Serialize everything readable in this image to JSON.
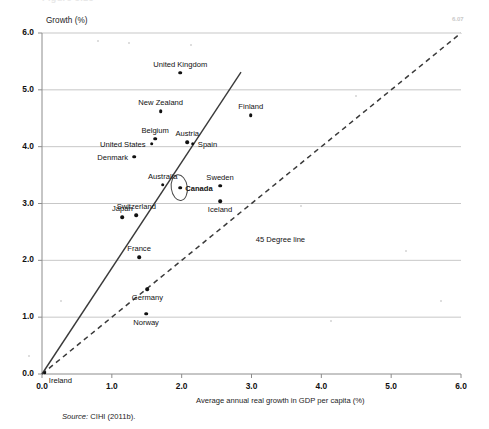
{
  "figure": {
    "clipped_title": "Figure 3.13",
    "corner_note": "6.07",
    "source_prefix": "Source:",
    "source_text": "CIHI (2011b)."
  },
  "chart_data": {
    "type": "scatter",
    "title": "",
    "xlabel": "Average annual real growth in GDP per capita (%)",
    "ylabel": "Growth (%)",
    "xlim": [
      0.0,
      6.0
    ],
    "ylim": [
      0.0,
      6.0
    ],
    "grid": "horizontal",
    "legend_position": "none",
    "xticks": [
      "0.0",
      "1.0",
      "2.0",
      "3.0",
      "4.0",
      "5.0",
      "6.0"
    ],
    "yticks": [
      "0.0",
      "1.0",
      "2.0",
      "3.0",
      "4.0",
      "5.0",
      "6.0"
    ],
    "annotations": [
      {
        "text": "45 Degree line",
        "x": 3.06,
        "y": 2.35
      }
    ],
    "reference_lines": [
      {
        "name": "45-degree-line",
        "style": "dashed",
        "from": [
          0.0,
          0.0
        ],
        "to": [
          6.0,
          6.0
        ]
      },
      {
        "name": "trend-line",
        "style": "solid",
        "from": [
          0.0,
          0.0
        ],
        "to": [
          2.85,
          5.31
        ]
      }
    ],
    "highlight": {
      "label": "Canada",
      "shape": "ellipse"
    },
    "points": [
      {
        "label": "United Kingdom",
        "x": 1.98,
        "y": 5.3,
        "label_pos": "above"
      },
      {
        "label": "New Zealand",
        "x": 1.7,
        "y": 4.62,
        "label_pos": "above"
      },
      {
        "label": "Finland",
        "x": 2.99,
        "y": 4.55,
        "label_pos": "above"
      },
      {
        "label": "Belgium",
        "x": 1.62,
        "y": 4.14,
        "label_pos": "above"
      },
      {
        "label": "Austria",
        "x": 2.08,
        "y": 4.08,
        "label_pos": "above"
      },
      {
        "label": "Spain",
        "x": 2.16,
        "y": 4.05,
        "label_pos": "right"
      },
      {
        "label": "United States",
        "x": 1.57,
        "y": 4.05,
        "label_pos": "left"
      },
      {
        "label": "Denmark",
        "x": 1.32,
        "y": 3.82,
        "label_pos": "left"
      },
      {
        "label": "Australia",
        "x": 1.73,
        "y": 3.33,
        "label_pos": "above"
      },
      {
        "label": "Canada",
        "x": 1.98,
        "y": 3.28,
        "label_pos": "right"
      },
      {
        "label": "Sweden",
        "x": 2.55,
        "y": 3.31,
        "label_pos": "above"
      },
      {
        "label": "Iceland",
        "x": 2.55,
        "y": 3.04,
        "label_pos": "below"
      },
      {
        "label": "Switzerland",
        "x": 1.35,
        "y": 2.79,
        "label_pos": "above"
      },
      {
        "label": "Japan",
        "x": 1.15,
        "y": 2.76,
        "label_pos": "above"
      },
      {
        "label": "France",
        "x": 1.39,
        "y": 2.06,
        "label_pos": "above"
      },
      {
        "label": "Germany",
        "x": 1.51,
        "y": 1.49,
        "label_pos": "below"
      },
      {
        "label": "Norway",
        "x": 1.49,
        "y": 1.06,
        "label_pos": "below"
      },
      {
        "label": "Ireland",
        "x": 0.04,
        "y": 0.02,
        "label_pos": "below-right"
      }
    ]
  }
}
